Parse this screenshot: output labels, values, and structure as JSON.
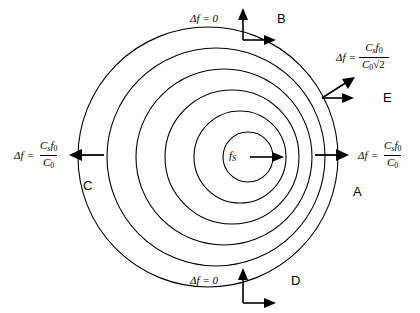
{
  "figure": {
    "type": "doppler-wavefront-diagram",
    "background": "#ffffff",
    "stroke": "#000000",
    "width": 420,
    "height": 313
  },
  "source": {
    "label": "f",
    "label_sub": "S",
    "velocity_arrow": "right",
    "center_x": 248,
    "center_y": 157
  },
  "chart_data": {
    "type": "scatter",
    "title": "",
    "xlabel": "",
    "ylabel": "",
    "circles": [
      {
        "index": 1,
        "cx": 248,
        "cy": 157,
        "r": 25
      },
      {
        "index": 2,
        "cx": 240,
        "cy": 157,
        "r": 46
      },
      {
        "index": 3,
        "cx": 232,
        "cy": 157,
        "r": 67
      },
      {
        "index": 4,
        "cx": 224,
        "cy": 157,
        "r": 88
      },
      {
        "index": 5,
        "cx": 216,
        "cy": 157,
        "r": 109
      },
      {
        "index": 6,
        "cx": 208,
        "cy": 157,
        "r": 130
      }
    ]
  },
  "annotations": {
    "top": {
      "letter": "B",
      "equation": "Δf = 0",
      "arrows": [
        "up",
        "right"
      ]
    },
    "bottom": {
      "letter": "D",
      "equation": "Δf = 0",
      "arrows": [
        "up",
        "right"
      ]
    },
    "left": {
      "letter": "C",
      "delta": "Δf",
      "equals": "=",
      "numerator_c": "C",
      "numerator_c_sub": "s",
      "numerator_f": "f",
      "numerator_f_sub": "0",
      "denominator_c": "C",
      "denominator_c_sub": "0",
      "arrow": "left"
    },
    "right": {
      "letter": "A",
      "delta": "Δf",
      "equals": "=",
      "numerator_c": "C",
      "numerator_c_sub": "s",
      "numerator_f": "f",
      "numerator_f_sub": "0",
      "denominator_c": "C",
      "denominator_c_sub": "0",
      "arrow": "right"
    },
    "diagonal": {
      "letter": "E",
      "delta": "Δf",
      "equals": "=",
      "numerator_c": "C",
      "numerator_c_sub": "s",
      "numerator_f": "f",
      "numerator_f_sub": "0",
      "denominator_c": "C",
      "denominator_c_sub": "0",
      "denominator_radical": "√",
      "denominator_radicand": "2",
      "arrows": [
        "diagonal-up-right",
        "right"
      ]
    }
  }
}
